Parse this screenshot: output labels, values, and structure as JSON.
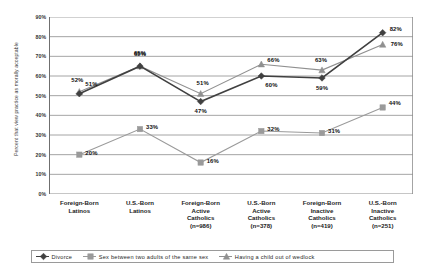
{
  "chart_data": {
    "type": "line",
    "title": "",
    "xlabel": "",
    "ylabel": "Percent that view practice as morally acceptable",
    "ylim": [
      0,
      90
    ],
    "ytick_step": 10,
    "ytick_labels": [
      "90%",
      "80%",
      "70%",
      "60%",
      "50%",
      "40%",
      "30%",
      "20%",
      "10%",
      "0%"
    ],
    "grid": true,
    "legend_position": "bottom",
    "categories": [
      {
        "lines": [
          "Foreign-Born",
          "Latinos"
        ]
      },
      {
        "lines": [
          "U.S.-Born",
          "Latinos"
        ]
      },
      {
        "lines": [
          "Foreign-Born",
          "Active",
          "Catholics",
          "(n=986)"
        ]
      },
      {
        "lines": [
          "U.S.-Born",
          "Active",
          "Catholics",
          "(n=378)"
        ]
      },
      {
        "lines": [
          "Foreign-Born",
          "Inactive",
          "Catholics",
          "(n=419)"
        ]
      },
      {
        "lines": [
          "U.S.-Born",
          "Inactive",
          "Catholics",
          "(n=251)"
        ]
      }
    ],
    "series": [
      {
        "name": "Divorce",
        "marker": "diamond",
        "color": "#404040",
        "values": [
          51,
          65,
          47,
          60,
          59,
          82
        ],
        "labels": [
          "51%",
          "65%",
          "47%",
          "60%",
          "59%",
          "82%"
        ]
      },
      {
        "name": "Sex between two adults of the same sex",
        "marker": "square",
        "color": "#9a9a9a",
        "values": [
          20,
          33,
          16,
          32,
          31,
          44
        ],
        "labels": [
          "20%",
          "33%",
          "16%",
          "32%",
          "31%",
          "44%"
        ]
      },
      {
        "name": "Having a child out of wedlock",
        "marker": "triangle",
        "color": "#909090",
        "values": [
          52,
          65,
          51,
          66,
          63,
          76
        ],
        "labels": [
          "52%",
          "65%",
          "51%",
          "66%",
          "63%",
          "76%"
        ]
      }
    ]
  }
}
